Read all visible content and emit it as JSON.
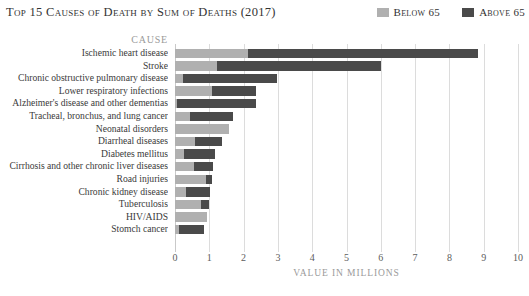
{
  "header": {
    "title": "Top 15 Causes of Death by Sum of Deaths (2017)"
  },
  "legend": {
    "position": "top-right",
    "items": [
      {
        "label": "Below 65",
        "color": "#b0b0b0"
      },
      {
        "label": "Above 65",
        "color": "#4a4a4a"
      }
    ]
  },
  "axes": {
    "y_axis_title": "CAUSE",
    "x_axis_title": "VALUE IN MILLIONS",
    "x_ticks": [
      "0",
      "1",
      "2",
      "3",
      "4",
      "5",
      "6",
      "7",
      "8",
      "9",
      "10"
    ]
  },
  "colors": {
    "below_65": "#b0b0b0",
    "above_65": "#4a4a4a",
    "gridline": "#dcdcdc",
    "axis_text": "#5c5c5c",
    "label_text": "#3a3a3a",
    "muted_text": "#9a9a9a",
    "background": "#ffffff"
  },
  "chart_data": {
    "type": "bar",
    "orientation": "horizontal",
    "stacked": true,
    "title": "Top 15 Causes of Death by Sum of Deaths (2017)",
    "xlabel": "VALUE IN MILLIONS",
    "ylabel": "CAUSE",
    "xlim": [
      0,
      10
    ],
    "xticks": [
      0,
      1,
      2,
      3,
      4,
      5,
      6,
      7,
      8,
      9,
      10
    ],
    "grid": true,
    "legend_position": "top-right",
    "units": "millions of deaths",
    "categories": [
      "Ischemic heart disease",
      "Stroke",
      "Chronic obstructive pulmonary disease",
      "Lower respiratory infections",
      "Alzheimer's disease and other dementias",
      "Tracheal, bronchus, and lung cancer",
      "Neonatal disorders",
      "Diarrheal diseases",
      "Diabetes mellitus",
      "Cirrhosis and other chronic liver diseases",
      "Road injuries",
      "Chronic kidney disease",
      "Tuberculosis",
      "HIV/AIDS",
      "Stomch cancer"
    ],
    "series": [
      {
        "name": "Below 65",
        "color": "#b0b0b0",
        "values": [
          2.13,
          1.22,
          0.23,
          1.08,
          0.05,
          0.44,
          1.57,
          0.58,
          0.26,
          0.55,
          0.9,
          0.32,
          0.75,
          0.92,
          0.12
        ]
      },
      {
        "name": "Above 65",
        "color": "#4a4a4a",
        "values": [
          6.7,
          4.78,
          2.74,
          1.28,
          2.31,
          1.25,
          0.0,
          0.79,
          0.91,
          0.56,
          0.17,
          0.71,
          0.25,
          0.0,
          0.72
        ]
      }
    ],
    "totals": [
      8.83,
      6.0,
      2.97,
      2.36,
      2.36,
      1.69,
      1.57,
      1.37,
      1.17,
      1.11,
      1.07,
      1.03,
      1.0,
      0.92,
      0.84
    ]
  }
}
